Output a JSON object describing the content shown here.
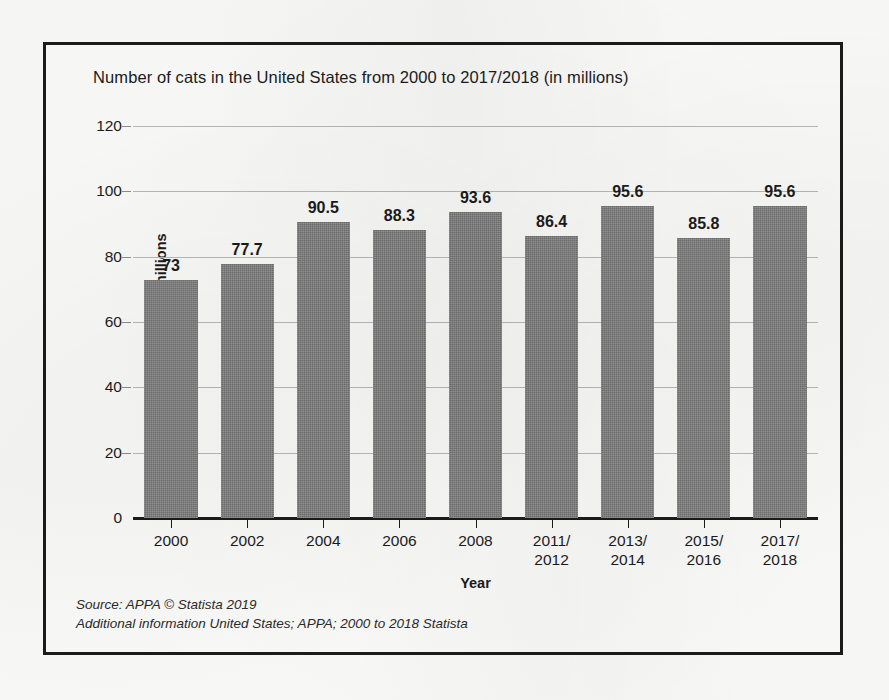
{
  "chart_data": {
    "type": "bar",
    "title": "Number of cats in the United States from 2000 to 2017/2018 (in millions)",
    "xlabel": "Year",
    "ylabel": "Number of catsin millions",
    "categories": [
      "2000",
      "2002",
      "2004",
      "2006",
      "2008",
      "2011/\n2012",
      "2013/\n2014",
      "2015/\n2016",
      "2017/\n2018"
    ],
    "category_lines": [
      [
        "2000"
      ],
      [
        "2002"
      ],
      [
        "2004"
      ],
      [
        "2006"
      ],
      [
        "2008"
      ],
      [
        "2011/",
        "2012"
      ],
      [
        "2013/",
        "2014"
      ],
      [
        "2015/",
        "2016"
      ],
      [
        "2017/",
        "2018"
      ]
    ],
    "values": [
      73,
      77.7,
      90.5,
      88.3,
      93.6,
      86.4,
      95.6,
      85.8,
      95.6
    ],
    "value_labels": [
      "73",
      "77.7",
      "90.5",
      "88.3",
      "93.6",
      "86.4",
      "95.6",
      "85.8",
      "95.6"
    ],
    "ylim": [
      0,
      120
    ],
    "yticks": [
      0,
      20,
      40,
      60,
      80,
      100,
      120
    ],
    "ytick_labels": [
      "0",
      "20",
      "40",
      "60",
      "80",
      "100",
      "120"
    ],
    "grid": true,
    "legend": null,
    "bar_color": "#7d7d7d",
    "axis_color": "#1b1b1b",
    "gridline_color": "#b9b9b9"
  },
  "source": {
    "line1": "Source: APPA © Statista 2019",
    "line2": "Additional information United States; APPA; 2000 to 2018 Statista"
  }
}
